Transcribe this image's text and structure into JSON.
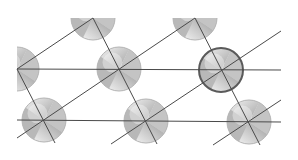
{
  "diagram": {
    "type": "2d-lattice",
    "colors": {
      "background": "#ffffff",
      "line": "#4a4a4a",
      "atom_light": "#ececec",
      "atom_dark": "#a8a8a8",
      "atom_border": "#b5b5b5",
      "highlight_border": "#5a5a5a"
    },
    "atom_radius": 22,
    "atoms": [
      {
        "id": "a1",
        "cx": 93,
        "cy": 18,
        "clip": "bottom-half",
        "highlight": false
      },
      {
        "id": "a2",
        "cx": 195,
        "cy": 18,
        "clip": "bottom-half",
        "highlight": false
      },
      {
        "id": "a3",
        "cx": 17,
        "cy": 69,
        "clip": "right-half",
        "highlight": false
      },
      {
        "id": "a4",
        "cx": 119,
        "cy": 69,
        "clip": "none",
        "highlight": false
      },
      {
        "id": "a5",
        "cx": 221,
        "cy": 70,
        "clip": "none",
        "highlight": true
      },
      {
        "id": "a6",
        "cx": 44,
        "cy": 120,
        "clip": "none",
        "highlight": false
      },
      {
        "id": "a7",
        "cx": 146,
        "cy": 121,
        "clip": "none",
        "highlight": false
      },
      {
        "id": "a8",
        "cx": 249,
        "cy": 122,
        "clip": "none",
        "highlight": false
      }
    ],
    "lines": [
      {
        "id": "h1",
        "x1": 17,
        "y1": 69,
        "x2": 281,
        "y2": 70
      },
      {
        "id": "h2",
        "x1": 17,
        "y1": 120,
        "x2": 281,
        "y2": 122
      },
      {
        "id": "d1",
        "x1": 17,
        "y1": 69,
        "x2": 93,
        "y2": 18
      },
      {
        "id": "d2",
        "x1": 17,
        "y1": 138,
        "x2": 195,
        "y2": 18
      },
      {
        "id": "d3",
        "x1": 111,
        "y1": 144,
        "x2": 281,
        "y2": 31
      },
      {
        "id": "d4",
        "x1": 213,
        "y1": 145,
        "x2": 281,
        "y2": 100
      },
      {
        "id": "s1",
        "x1": 17,
        "y1": 69,
        "x2": 55,
        "y2": 143
      },
      {
        "id": "s2",
        "x1": 93,
        "y1": 18,
        "x2": 157,
        "y2": 144
      },
      {
        "id": "s3",
        "x1": 195,
        "y1": 18,
        "x2": 260,
        "y2": 145
      }
    ]
  }
}
